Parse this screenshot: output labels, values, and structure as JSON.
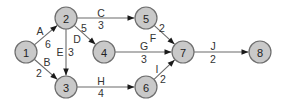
{
  "diagram": {
    "type": "activity-on-arrow network",
    "nodes": [
      {
        "id": "1",
        "label": "1",
        "x": 26,
        "y": 52
      },
      {
        "id": "2",
        "label": "2",
        "x": 66,
        "y": 18
      },
      {
        "id": "3",
        "label": "3",
        "x": 66,
        "y": 87
      },
      {
        "id": "4",
        "label": "4",
        "x": 104,
        "y": 52
      },
      {
        "id": "5",
        "label": "5",
        "x": 146,
        "y": 18
      },
      {
        "id": "6",
        "label": "6",
        "x": 146,
        "y": 87
      },
      {
        "id": "7",
        "label": "7",
        "x": 183,
        "y": 52
      },
      {
        "id": "8",
        "label": "8",
        "x": 260,
        "y": 52
      }
    ],
    "edges": [
      {
        "activity": "A",
        "duration": "6",
        "from": "1",
        "to": "2",
        "ax": 40,
        "ay": 31,
        "dx": 48,
        "dy": 44
      },
      {
        "activity": "B",
        "duration": "2",
        "from": "1",
        "to": "3",
        "ax": 47,
        "ay": 62,
        "dx": 39,
        "dy": 73
      },
      {
        "activity": "C",
        "duration": "3",
        "from": "2",
        "to": "5",
        "ax": 101,
        "ay": 13,
        "dx": 101,
        "dy": 25
      },
      {
        "activity": "D",
        "duration": "5",
        "from": "2",
        "to": "4",
        "ax": 77,
        "ay": 39,
        "dx": 84,
        "dy": 28
      },
      {
        "activity": "E",
        "duration": "3",
        "from": "2",
        "to": "3",
        "ax": 60,
        "ay": 52,
        "dx": 71,
        "dy": 52
      },
      {
        "activity": "F",
        "duration": "2",
        "from": "5",
        "to": "7",
        "ax": 153,
        "ay": 38,
        "dx": 162,
        "dy": 28
      },
      {
        "activity": "G",
        "duration": "3",
        "from": "4",
        "to": "7",
        "ax": 144,
        "ay": 46,
        "dx": 144,
        "dy": 59
      },
      {
        "activity": "H",
        "duration": "4",
        "from": "3",
        "to": "6",
        "ax": 101,
        "ay": 81,
        "dx": 101,
        "dy": 93
      },
      {
        "activity": "I",
        "duration": "2",
        "from": "6",
        "to": "7",
        "ax": 157,
        "ay": 69,
        "dx": 163,
        "dy": 79
      },
      {
        "activity": "J",
        "duration": "2",
        "from": "7",
        "to": "8",
        "ax": 213,
        "ay": 46,
        "dx": 213,
        "dy": 59
      }
    ],
    "colors": {
      "node_fill": "#c9c9c9",
      "node_stroke": "#6e6e6e",
      "edge": "#6a6a6a",
      "arrow": "#1a1a1a",
      "text": "#222222"
    }
  }
}
